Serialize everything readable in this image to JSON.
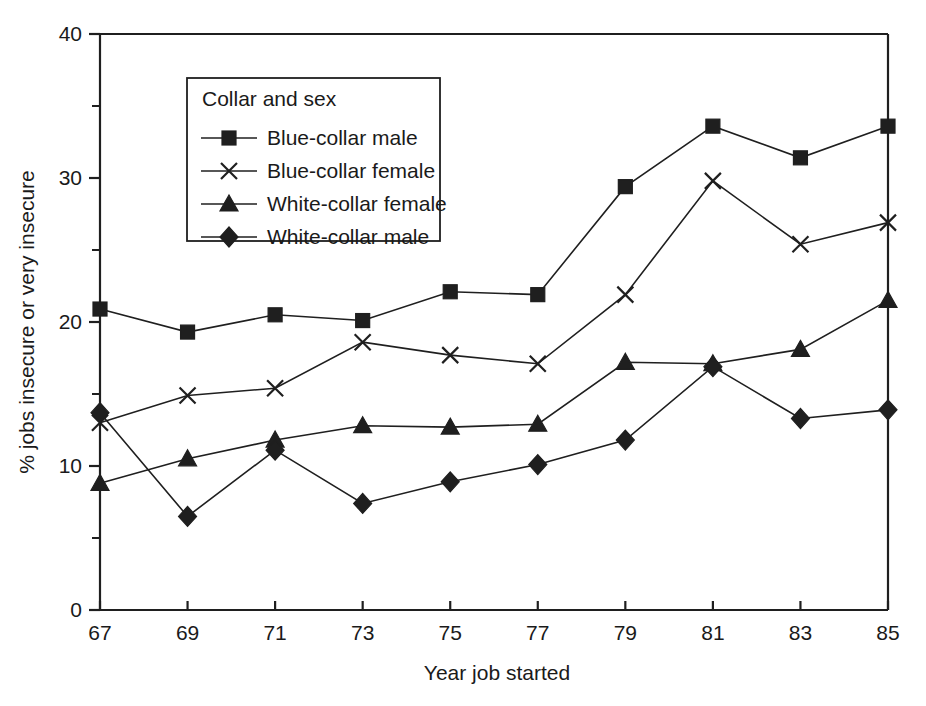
{
  "chart_data": {
    "type": "line",
    "title": "",
    "xlabel": "Year job started",
    "ylabel": "% jobs insecure or very insecure",
    "x": [
      67,
      69,
      71,
      73,
      75,
      77,
      79,
      81,
      83,
      85
    ],
    "xticklabels": [
      "67",
      "69",
      "71",
      "73",
      "75",
      "77",
      "79",
      "81",
      "83",
      "85"
    ],
    "yticklabels": [
      "0",
      "10",
      "20",
      "30",
      "40"
    ],
    "ytickvalues": [
      0,
      10,
      20,
      30,
      40
    ],
    "yminorticks": [
      5,
      15,
      25,
      35
    ],
    "xlim": [
      67,
      85
    ],
    "ylim": [
      0,
      40
    ],
    "grid": false,
    "legend_title": "Collar and sex",
    "legend_position": "upper-left-inside",
    "series": [
      {
        "name": "Blue-collar male",
        "marker": "square",
        "values": [
          20.9,
          19.3,
          20.5,
          20.1,
          22.1,
          21.9,
          29.4,
          33.6,
          31.4,
          33.6
        ]
      },
      {
        "name": "Blue-collar female",
        "marker": "cross",
        "values": [
          13.0,
          14.9,
          15.4,
          18.6,
          17.7,
          17.1,
          21.9,
          29.8,
          25.4,
          26.9
        ]
      },
      {
        "name": "White-collar female",
        "marker": "triangle",
        "values": [
          8.8,
          10.5,
          11.8,
          12.8,
          12.7,
          12.9,
          17.2,
          17.1,
          18.1,
          21.5
        ]
      },
      {
        "name": "White-collar male",
        "marker": "diamond",
        "values": [
          13.7,
          6.5,
          11.1,
          7.4,
          8.9,
          10.1,
          11.8,
          16.9,
          13.3,
          13.9
        ]
      }
    ]
  },
  "colors": {
    "ink": "#1f1f1f",
    "background": "#ffffff"
  }
}
